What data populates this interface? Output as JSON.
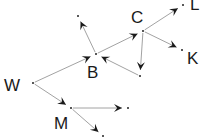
{
  "diagram": {
    "type": "directed-graph",
    "nodes": [
      {
        "id": "W",
        "label": "W",
        "x": 33,
        "y": 83,
        "lx": 4,
        "ly": 91
      },
      {
        "id": "B",
        "label": "B",
        "x": 96,
        "y": 54,
        "lx": 87,
        "ly": 78
      },
      {
        "id": "C",
        "label": "C",
        "x": 143,
        "y": 31,
        "lx": 131,
        "ly": 23
      },
      {
        "id": "L",
        "label": "L",
        "x": 183,
        "y": 5,
        "lx": 190,
        "ly": 10
      },
      {
        "id": "K",
        "label": "K",
        "x": 182,
        "y": 50,
        "lx": 187,
        "ly": 64
      },
      {
        "id": "M",
        "label": "M",
        "x": 71,
        "y": 108,
        "lx": 54,
        "ly": 129
      },
      {
        "id": "n1",
        "label": "",
        "x": 78,
        "y": 16
      },
      {
        "id": "n2",
        "label": "",
        "x": 140,
        "y": 76
      },
      {
        "id": "n3",
        "label": "",
        "x": 128,
        "y": 108
      },
      {
        "id": "n4",
        "label": "",
        "x": 103,
        "y": 136
      }
    ],
    "edges": [
      {
        "from": "W",
        "to": "B"
      },
      {
        "from": "W",
        "to": "M"
      },
      {
        "from": "B",
        "to": "n1"
      },
      {
        "from": "B",
        "to": "C"
      },
      {
        "from": "n2",
        "to": "B"
      },
      {
        "from": "C",
        "to": "L"
      },
      {
        "from": "C",
        "to": "K"
      },
      {
        "from": "C",
        "to": "n2"
      },
      {
        "from": "M",
        "to": "n3"
      },
      {
        "from": "M",
        "to": "n4"
      }
    ],
    "colors": {
      "edge": "#8a8a8a",
      "arrow": "#1a1a1a",
      "label": "#1a1a1a"
    }
  }
}
